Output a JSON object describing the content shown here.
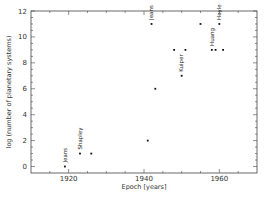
{
  "chart_data": {
    "type": "scatter",
    "title": "",
    "xlabel": "Epoch [years]",
    "ylabel": "log (number of planetary systems)",
    "xlim": [
      1910,
      1970
    ],
    "ylim": [
      -0.5,
      12
    ],
    "xticks": [
      1920,
      1940,
      1960
    ],
    "xtick_labels": [
      "1920",
      "1940",
      "1960"
    ],
    "yticks": [
      0,
      2,
      4,
      6,
      8,
      10,
      12
    ],
    "ytick_labels": [
      "0",
      "2",
      "4",
      "6",
      "8",
      "10",
      "12"
    ],
    "grid": false,
    "legend": null,
    "points": [
      {
        "x": 1919,
        "y": 0,
        "label": "Jeans"
      },
      {
        "x": 1923,
        "y": 1,
        "label": "Shapley"
      },
      {
        "x": 1926,
        "y": 1,
        "label": ""
      },
      {
        "x": 1941,
        "y": 2,
        "label": ""
      },
      {
        "x": 1942,
        "y": 11,
        "label": "Jeans"
      },
      {
        "x": 1943,
        "y": 6,
        "label": ""
      },
      {
        "x": 1948,
        "y": 9,
        "label": ""
      },
      {
        "x": 1950,
        "y": 7,
        "label": "Kuiper"
      },
      {
        "x": 1951,
        "y": 9,
        "label": ""
      },
      {
        "x": 1955,
        "y": 11,
        "label": ""
      },
      {
        "x": 1958,
        "y": 9,
        "label": "Huang"
      },
      {
        "x": 1959,
        "y": 9,
        "label": ""
      },
      {
        "x": 1960,
        "y": 11,
        "label": "Hoyle"
      },
      {
        "x": 1961,
        "y": 9,
        "label": ""
      }
    ]
  }
}
